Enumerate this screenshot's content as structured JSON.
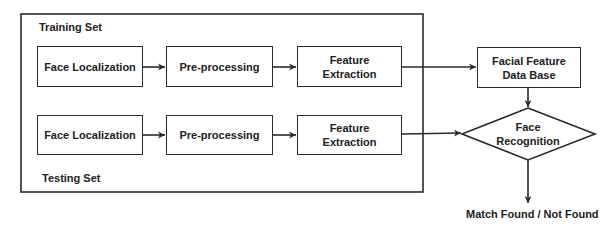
{
  "diagram": {
    "groups": {
      "training": {
        "label": "Training Set"
      },
      "testing": {
        "label": "Testing Set"
      }
    },
    "training_row": [
      {
        "id": "train-face-localization",
        "label": "Face Localization"
      },
      {
        "id": "train-pre-processing",
        "label": "Pre-processing"
      },
      {
        "id": "train-feature-extraction",
        "label": "Feature Extraction"
      }
    ],
    "testing_row": [
      {
        "id": "test-face-localization",
        "label": "Face Localization"
      },
      {
        "id": "test-pre-processing",
        "label": "Pre-processing"
      },
      {
        "id": "test-feature-extraction",
        "label": "Feature Extraction"
      }
    ],
    "database": {
      "label": "Facial Feature Data Base"
    },
    "decision": {
      "label": "Face Recognition"
    },
    "output": {
      "label": "Match Found / Not Found"
    },
    "edges": [
      {
        "from": "train-face-localization",
        "to": "train-pre-processing"
      },
      {
        "from": "train-pre-processing",
        "to": "train-feature-extraction"
      },
      {
        "from": "train-feature-extraction",
        "to": "database"
      },
      {
        "from": "test-face-localization",
        "to": "test-pre-processing"
      },
      {
        "from": "test-pre-processing",
        "to": "test-feature-extraction"
      },
      {
        "from": "test-feature-extraction",
        "to": "decision"
      },
      {
        "from": "database",
        "to": "decision"
      },
      {
        "from": "decision",
        "to": "output"
      }
    ],
    "colors": {
      "stroke": "#2a2a2a",
      "text": "#222222",
      "background": "#ffffff"
    }
  }
}
